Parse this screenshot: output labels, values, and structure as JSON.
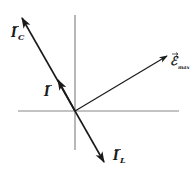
{
  "diagram": {
    "type": "phasor-diagram",
    "colors": {
      "axis": "#888888",
      "vector": "#1a1a1a",
      "background": "#ffffff"
    },
    "axes": {
      "origin": [
        75,
        111
      ],
      "horizontal": {
        "x1": 18,
        "x2": 179,
        "y": 111
      },
      "vertical": {
        "x": 75,
        "y1": 15,
        "y2": 150
      }
    },
    "vectors": [
      {
        "id": "I_C",
        "label": "I",
        "subscript": "C",
        "from": [
          75,
          111
        ],
        "to": [
          22,
          18
        ]
      },
      {
        "id": "I",
        "label": "I",
        "subscript": "",
        "from": [
          75,
          111
        ],
        "to": [
          58,
          79
        ]
      },
      {
        "id": "I_L",
        "label": "I",
        "subscript": "L",
        "from": [
          75,
          111
        ],
        "to": [
          104,
          162
        ]
      },
      {
        "id": "E_max",
        "label": "ℰ",
        "subscript": "max",
        "from": [
          75,
          111
        ],
        "to": [
          167,
          56
        ]
      }
    ],
    "labels": {
      "I_C": {
        "main": "I",
        "sub": "C",
        "x": 11,
        "y": 37
      },
      "I": {
        "main": "I",
        "sub": "",
        "x": 44,
        "y": 96
      },
      "I_L": {
        "main": "I",
        "sub": "L",
        "x": 113,
        "y": 160
      },
      "E_max": {
        "main": "ℰ",
        "sub": "max",
        "x": 170,
        "y": 66
      }
    }
  }
}
